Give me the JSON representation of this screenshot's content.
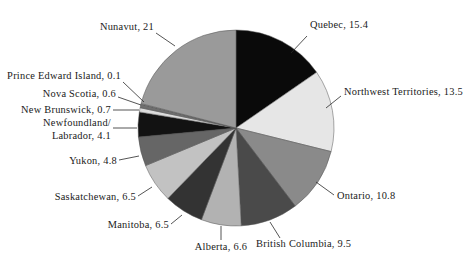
{
  "chart_data": {
    "type": "pie",
    "title": "",
    "subtitle": "",
    "xlabel": "",
    "ylabel": "",
    "legend_position": "none",
    "grid": false,
    "label_format": "{name}, {value}",
    "categories": [
      "Quebec",
      "Northwest Territories",
      "Ontario",
      "British Columbia",
      "Alberta",
      "Manitoba",
      "Saskatchewan",
      "Yukon",
      "Newfoundland/Labrador",
      "New Brunswick",
      "Nova Scotia",
      "Prince Edward Island",
      "Nunavut"
    ],
    "values": [
      15.4,
      13.5,
      10.8,
      9.5,
      6.6,
      6.5,
      6.5,
      4.8,
      4.1,
      0.7,
      0.6,
      0.1,
      21
    ],
    "colors": [
      "#0a0a0a",
      "#e6e6e6",
      "#8a8a8a",
      "#4a4a4a",
      "#b2b2b2",
      "#333333",
      "#c2c2c2",
      "#666666",
      "#121212",
      "#dcdcdc",
      "#6e6e6e",
      "#f2f2f2",
      "#9a9a9a"
    ],
    "slices": [
      {
        "name": "Quebec",
        "value": 15.4,
        "color": "#0a0a0a",
        "label": "Quebec, 15.4"
      },
      {
        "name": "Northwest Territories",
        "value": 13.5,
        "color": "#e6e6e6",
        "label": "Northwest Territories, 13.5"
      },
      {
        "name": "Ontario",
        "value": 10.8,
        "color": "#8a8a8a",
        "label": "Ontario, 10.8"
      },
      {
        "name": "British Columbia",
        "value": 9.5,
        "color": "#4a4a4a",
        "label": "British Columbia, 9.5"
      },
      {
        "name": "Alberta",
        "value": 6.6,
        "color": "#b2b2b2",
        "label": "Alberta, 6.6"
      },
      {
        "name": "Manitoba",
        "value": 6.5,
        "color": "#333333",
        "label": "Manitoba, 6.5"
      },
      {
        "name": "Saskatchewan",
        "value": 6.5,
        "color": "#c2c2c2",
        "label": "Saskatchewan, 6.5"
      },
      {
        "name": "Yukon",
        "value": 4.8,
        "color": "#666666",
        "label": "Yukon, 4.8"
      },
      {
        "name": "Newfoundland/Labrador",
        "value": 4.1,
        "color": "#121212",
        "label": "Newfoundland/ Labrador, 4.1"
      },
      {
        "name": "New Brunswick",
        "value": 0.7,
        "color": "#dcdcdc",
        "label": "New Brunswick, 0.7"
      },
      {
        "name": "Nova Scotia",
        "value": 0.6,
        "color": "#6e6e6e",
        "label": "Nova Scotia, 0.6"
      },
      {
        "name": "Prince Edward Island",
        "value": 0.1,
        "color": "#f2f2f2",
        "label": "Prince Edward Island, 0.1"
      },
      {
        "name": "Nunavut",
        "value": 21,
        "color": "#9a9a9a",
        "label": "Nunavut, 21"
      }
    ],
    "total": 100.1
  },
  "labels": {
    "quebec": "Quebec, 15.4",
    "northwest_territories": "Northwest Territories, 13.5",
    "ontario": "Ontario, 10.8",
    "british_columbia": "British Columbia, 9.5",
    "alberta": "Alberta, 6.6",
    "manitoba": "Manitoba, 6.5",
    "saskatchewan": "Saskatchewan, 6.5",
    "yukon": "Yukon, 4.8",
    "newfoundland_line1": "Newfoundland/",
    "newfoundland_line2": "Labrador, 4.1",
    "new_brunswick": "New Brunswick, 0.7",
    "nova_scotia": "Nova Scotia, 0.6",
    "prince_edward_island": "Prince Edward Island, 0.1",
    "nunavut": "Nunavut, 21"
  }
}
